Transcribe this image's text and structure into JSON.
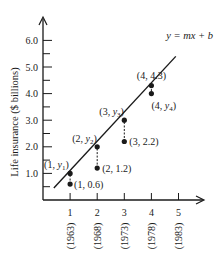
{
  "chart_data": {
    "type": "scatter",
    "title": "",
    "xlabel": "",
    "ylabel": "Life insurance ($ billions)",
    "xlim": [
      0,
      5.9
    ],
    "ylim": [
      0,
      6.6
    ],
    "grid": false,
    "x_ticks": [
      "1",
      "2",
      "3",
      "4",
      "5"
    ],
    "x_tick_years": [
      "(1963)",
      "(1968)",
      "(1973)",
      "(1978)",
      "(1983)"
    ],
    "y_ticks": [
      "1.0",
      "2.0",
      "3.0",
      "4.0",
      "5.0",
      "6.0"
    ],
    "line_label": "y = mx + b",
    "line": {
      "x0": 0.4,
      "y0": 0.45,
      "x1": 4.9,
      "y1": 5.4
    },
    "observed_points": [
      {
        "x": 1,
        "y": 0.6,
        "label": "(1, 0.6)"
      },
      {
        "x": 2,
        "y": 1.2,
        "label": "(2, 1.2)"
      },
      {
        "x": 3,
        "y": 2.2,
        "label": "(3, 2.2)"
      },
      {
        "x": 4,
        "y": 4.3,
        "label": "(4, 4.3)"
      }
    ],
    "line_points": [
      {
        "x": 1,
        "y": 1.0,
        "label_prefix": "(1, ",
        "sub": "1",
        "label": "(1, y1)"
      },
      {
        "x": 2,
        "y": 2.0,
        "label_prefix": "(2, ",
        "sub": "2",
        "label": "(2, y2)"
      },
      {
        "x": 3,
        "y": 3.0,
        "label_prefix": "(3, ",
        "sub": "3",
        "label": "(3, y3)"
      },
      {
        "x": 4,
        "y": 4.0,
        "label_prefix": "(4, ",
        "sub": "4",
        "label": "(4, y4)"
      }
    ]
  }
}
